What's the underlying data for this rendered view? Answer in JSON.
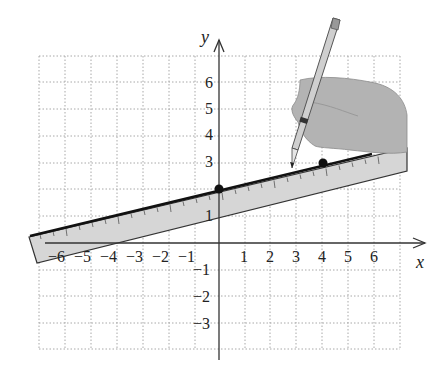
{
  "figure": {
    "x_axis_label": "x",
    "y_axis_label": "y",
    "x_ticks": [
      "−6",
      "−5",
      "−4",
      "−3",
      "−2",
      "−1",
      "1",
      "2",
      "3",
      "4",
      "5",
      "6"
    ],
    "y_ticks_positive": [
      "1",
      "2",
      "3",
      "4",
      "5",
      "6"
    ],
    "y_ticks_negative": [
      "−1",
      "−2",
      "−3"
    ],
    "points": [
      {
        "label": "(0, 2)",
        "x": 0,
        "y": 2
      },
      {
        "label": "(4, 3)",
        "x": 4,
        "y": 3
      }
    ],
    "line": {
      "slope": 0.25,
      "intercept": 2
    },
    "colors": {
      "grid": "#9a9a9a",
      "axis": "#333333",
      "ruler_fill": "#d9d9d9",
      "line": "#111111",
      "hand": "#b5b5b5",
      "pencil": "#c8c8c8"
    }
  }
}
